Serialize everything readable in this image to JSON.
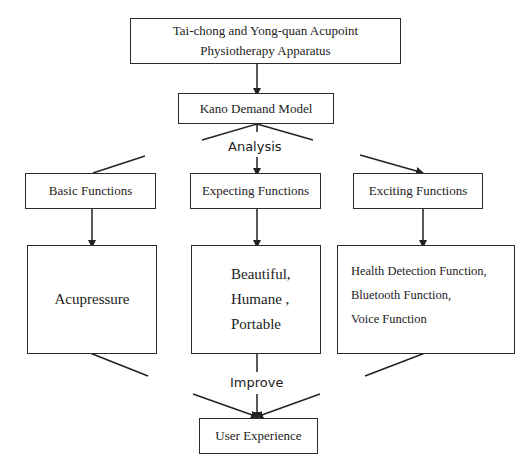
{
  "diagram": {
    "title_box": {
      "line1": "Tai-chong and Yong-quan Acupoint",
      "line2": "Physiotherapy Apparatus"
    },
    "model_box": "Kano Demand Model",
    "analysis_label": "Analysis",
    "categories": [
      {
        "label": "Basic Functions"
      },
      {
        "label": "Expecting Functions"
      },
      {
        "label": "Exciting Functions"
      }
    ],
    "details": [
      {
        "lines": [
          "Acupressure"
        ]
      },
      {
        "lines": [
          "Beautiful,",
          "Humane ,",
          "Portable"
        ]
      },
      {
        "lines": [
          "Health Detection Function,",
          "Bluetooth Function,",
          "Voice Function"
        ]
      }
    ],
    "improve_label": "Improve",
    "result_box": "User Experience"
  }
}
